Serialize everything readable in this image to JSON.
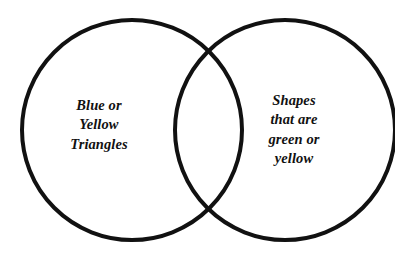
{
  "diagram": {
    "type": "venn-diagram",
    "set_count": 2,
    "background_color": "#ffffff",
    "stroke_color": "#111111",
    "stroke_width": 4,
    "text_color": "#111111",
    "circles": [
      {
        "id": "left-circle",
        "name": "left-set-circle",
        "cx": 132,
        "cy": 130,
        "r": 110
      },
      {
        "id": "right-circle",
        "name": "right-set-circle",
        "cx": 285,
        "cy": 130,
        "r": 110
      }
    ],
    "left_set": {
      "name": "left-set-label",
      "lines": [
        "Blue or",
        "Yellow",
        "Triangles"
      ],
      "text": "Blue or Yellow Triangles"
    },
    "right_set": {
      "name": "right-set-label",
      "lines": [
        "Shapes",
        "that are",
        "green or",
        "yellow"
      ],
      "text": "Shapes that are green or yellow"
    },
    "intersection": {
      "name": "intersection-region",
      "lines": [],
      "text": ""
    }
  }
}
